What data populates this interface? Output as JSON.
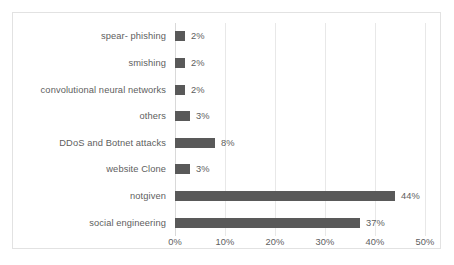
{
  "chart_data": {
    "type": "bar",
    "orientation": "horizontal",
    "title": "",
    "xlabel": "",
    "ylabel": "",
    "xlim": [
      0,
      50
    ],
    "grid": true,
    "legend": "none",
    "value_suffix": "%",
    "categories": [
      "spear- phishing",
      "smishing",
      "convolutional neural networks",
      "others",
      "DDoS and Botnet attacks",
      "website Clone",
      "notgiven",
      "social engineering"
    ],
    "values": [
      2,
      2,
      2,
      3,
      8,
      3,
      44,
      37
    ],
    "value_labels": [
      "2%",
      "2%",
      "2%",
      "3%",
      "8%",
      "3%",
      "44%",
      "37%"
    ],
    "xticks": [
      0,
      10,
      20,
      30,
      40,
      50
    ],
    "xtick_labels": [
      "0%",
      "10%",
      "20%",
      "30%",
      "40%",
      "50%"
    ],
    "colors": {
      "bar": "#595959",
      "text": "#5e5e5e",
      "gridline": "#e8e8e8",
      "border": "#e2e2e2",
      "background": "#ffffff"
    }
  }
}
